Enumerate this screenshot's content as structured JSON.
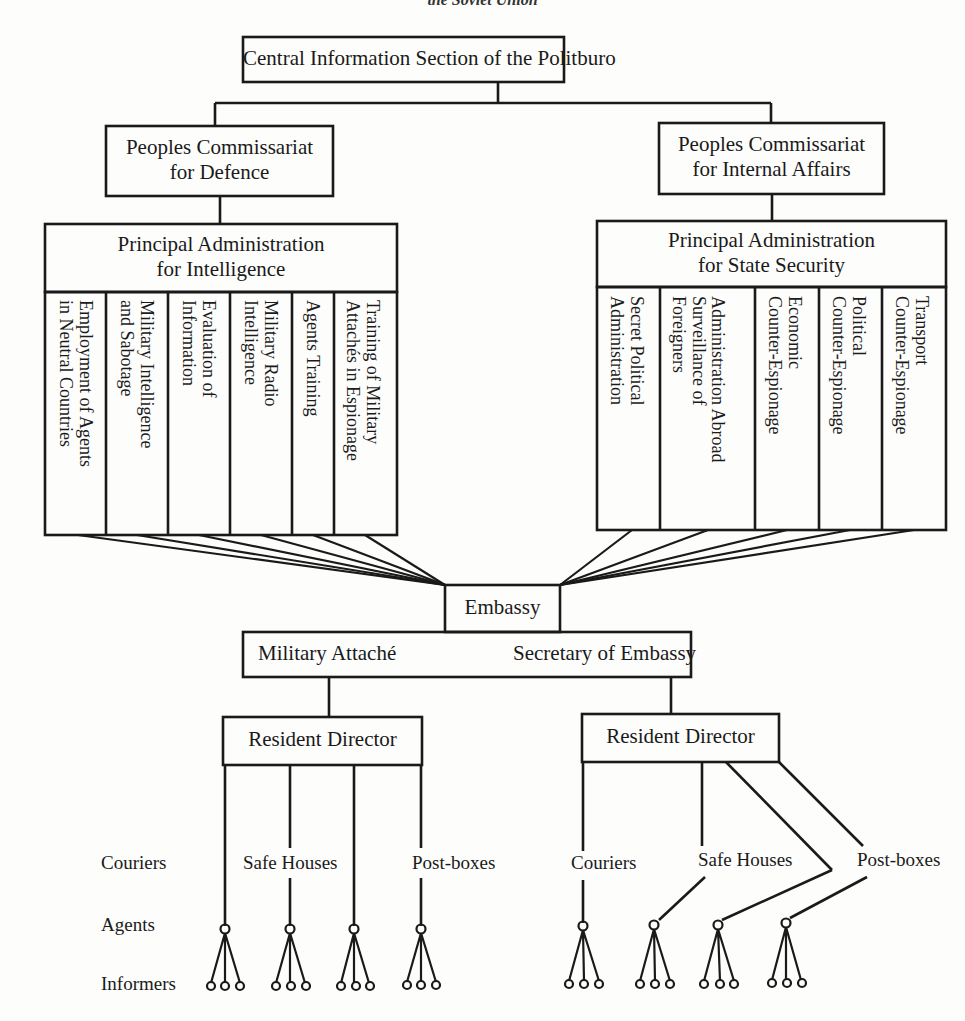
{
  "running_header": "the Soviet Union",
  "top": {
    "label": "Central Information Section of the Politburo"
  },
  "defence": {
    "commissariat": {
      "line1": "Peoples Commissariat",
      "line2": "for Defence"
    },
    "administration": {
      "line1": "Principal Administration",
      "line2": "for Intelligence"
    },
    "departments": [
      {
        "line1": "Employment of Agents",
        "line2": "in Neutral Countries"
      },
      {
        "line1": "Military Intelligence",
        "line2": "and Sabotage"
      },
      {
        "line1": "Evaluation of",
        "line2": "Information"
      },
      {
        "line1": "Military Radio",
        "line2": "Intelligence"
      },
      {
        "line1": "Agents Training",
        "line2": ""
      },
      {
        "line1": "Training of Military",
        "line2": "Attachés in Espionage"
      }
    ]
  },
  "internal": {
    "commissariat": {
      "line1": "Peoples Commissariat",
      "line2": "for Internal Affairs"
    },
    "administration": {
      "line1": "Principal Administration",
      "line2": "for State Security"
    },
    "departments": [
      {
        "line1": "Secret Political",
        "line2": "Administration"
      },
      {
        "line1": "Administration Abroad",
        "line2": "Surveillance of",
        "line3": "Foreigners"
      },
      {
        "line1": "Economic",
        "line2": "Counter-Espionage"
      },
      {
        "line1": "Political",
        "line2": "Counter-Espionage"
      },
      {
        "line1": "Transport",
        "line2": "Counter-Espionage"
      }
    ]
  },
  "embassy": {
    "label": "Embassy",
    "military_attache": "Military Attaché",
    "secretary": "Secretary of Embassy"
  },
  "residents": {
    "left": {
      "label": "Resident Director"
    },
    "right": {
      "label": "Resident Director"
    }
  },
  "channels": {
    "left": {
      "couriers": "Couriers",
      "safe_houses": "Safe Houses",
      "post_boxes": "Post-boxes"
    },
    "right": {
      "couriers": "Couriers",
      "safe_houses": "Safe Houses",
      "post_boxes": "Post-boxes"
    }
  },
  "row_labels": {
    "agents": "Agents",
    "informers": "Informers"
  },
  "colors": {
    "ink": "#1a1a1a",
    "paper": "#fdfdfc"
  }
}
